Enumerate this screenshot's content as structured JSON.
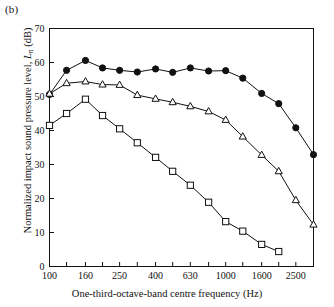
{
  "panel": {
    "label": "(b)"
  },
  "axes": {
    "ylabel_pre": "Normalized impact sound pressure level, ",
    "ylabel_sym": "L",
    "ylabel_sub": "n",
    "ylabel_post": " (dB)",
    "xlabel": "One-third-octave-band centre frequency (Hz)"
  },
  "chart_data": {
    "type": "line",
    "title": "",
    "xlabel": "One-third-octave-band centre frequency (Hz)",
    "ylabel": "Normalized impact sound pressure level, L_n (dB)",
    "xscale": "log",
    "xlim": [
      100,
      3150
    ],
    "ylim": [
      0,
      70
    ],
    "yticks": [
      0,
      10,
      20,
      30,
      40,
      50,
      60,
      70
    ],
    "xticks": [
      100,
      125,
      160,
      200,
      250,
      315,
      400,
      500,
      630,
      800,
      1000,
      1250,
      1600,
      2000,
      2500,
      3150
    ],
    "xticklabels": [
      "100",
      "",
      "160",
      "",
      "250",
      "",
      "400",
      "",
      "630",
      "",
      "1000",
      "",
      "1600",
      "",
      "2500",
      ""
    ],
    "grid": false,
    "legend": "none",
    "x": [
      100,
      125,
      160,
      200,
      250,
      315,
      400,
      500,
      630,
      800,
      1000,
      1250,
      1600,
      2000,
      2500,
      3150
    ],
    "series": [
      {
        "name": "bare-floor",
        "marker": "filled-circle",
        "color": "#111111",
        "values": [
          50.6,
          57.7,
          60.6,
          58.4,
          57.7,
          57.2,
          58.1,
          57.1,
          58.4,
          57.5,
          57.6,
          55.4,
          50.9,
          47.9,
          40.8,
          32.9
        ]
      },
      {
        "name": "floating-floor-A",
        "marker": "open-triangle",
        "color": "#111111",
        "values": [
          50.8,
          53.9,
          54.4,
          53.5,
          53.4,
          50.4,
          49.3,
          48.3,
          47.1,
          45.6,
          43.1,
          38.2,
          32.8,
          28.0,
          19.5,
          12.3
        ]
      },
      {
        "name": "floating-floor-B",
        "marker": "open-square",
        "color": "#111111",
        "values": [
          41.5,
          45.0,
          49.2,
          44.4,
          40.5,
          36.4,
          32.1,
          28.0,
          23.9,
          18.9,
          13.2,
          10.4,
          6.5,
          4.4,
          null,
          null
        ]
      }
    ]
  }
}
